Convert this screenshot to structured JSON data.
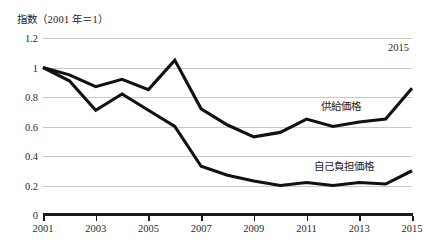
{
  "chart_data": {
    "type": "line",
    "title": "指数（2001 年＝1）",
    "xlabel": "",
    "ylabel": "指数（2001 年＝1）",
    "x": [
      2001,
      2002,
      2003,
      2004,
      2005,
      2006,
      2007,
      2008,
      2009,
      2010,
      2011,
      2012,
      2013,
      2014,
      2015
    ],
    "categories": [
      "2001",
      "2002",
      "2003",
      "2004",
      "2005",
      "2006",
      "2007",
      "2008",
      "2009",
      "2010",
      "2011",
      "2012",
      "2013",
      "2014",
      "2015"
    ],
    "series": [
      {
        "name": "供給価格",
        "values": [
          1.0,
          0.95,
          0.87,
          0.92,
          0.85,
          1.05,
          0.72,
          0.61,
          0.53,
          0.56,
          0.65,
          0.6,
          0.63,
          0.65,
          0.86
        ]
      },
      {
        "name": "自己負担価格",
        "values": [
          1.0,
          0.91,
          0.71,
          0.82,
          0.71,
          0.6,
          0.33,
          0.27,
          0.23,
          0.2,
          0.22,
          0.2,
          0.22,
          0.21,
          0.3
        ]
      }
    ],
    "xlim": [
      2001,
      2015
    ],
    "ylim": [
      0,
      1.2
    ],
    "ytick_labels": [
      "1.2",
      "1",
      "0.8",
      "0.6",
      "0.4",
      "0.2",
      "0"
    ],
    "ytick_values": [
      1.2,
      1.0,
      0.8,
      0.6,
      0.4,
      0.2,
      0
    ],
    "xtick_labels": [
      "2001",
      "2003",
      "2005",
      "2007",
      "2009",
      "2011",
      "2013",
      "2015"
    ],
    "xtick_values": [
      2001,
      2003,
      2005,
      2007,
      2009,
      2011,
      2013,
      2015
    ],
    "grid": true,
    "legend_position": "inline-annotations",
    "annotations": [
      {
        "text": "2015",
        "x": 2015,
        "y": 1.14
      }
    ],
    "colors": {
      "line": "#111111",
      "grid": "#c9c9c9",
      "axis": "#1a1a1a",
      "text": "#1d1d1d",
      "background": "#ffffff"
    }
  }
}
